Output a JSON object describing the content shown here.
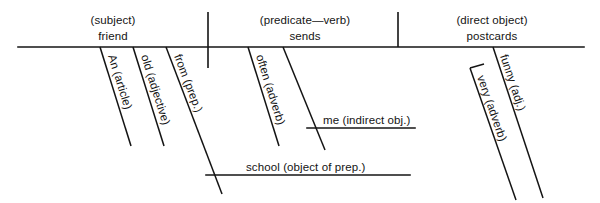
{
  "diagram": {
    "type": "reed-kellogg-sentence-diagram",
    "sentence": "An old friend from school often sends me very funny postcards.",
    "baseline": {
      "subject": {
        "role_label": "(subject)",
        "word_label": "friend"
      },
      "predicate": {
        "role_label": "(predicate—verb)",
        "word_label": "sends"
      },
      "direct_object": {
        "role_label": "(direct object)",
        "word_label": "postcards"
      }
    },
    "modifiers": [
      {
        "id": "article",
        "text": "An (article)",
        "attaches_to": "friend"
      },
      {
        "id": "adjective",
        "text": "old (adjective)",
        "attaches_to": "friend"
      },
      {
        "id": "preposition",
        "text": "from (prep.)",
        "attaches_to": "friend"
      },
      {
        "id": "adverb-often",
        "text": "often (adverb)",
        "attaches_to": "sends"
      },
      {
        "id": "indirect-object-slant",
        "text": "me (indirect obj.)",
        "attaches_to": "sends"
      },
      {
        "id": "object-of-prep",
        "text": "school (object of prep.)",
        "attaches_to": "from"
      },
      {
        "id": "adjective-funny",
        "text": "funny (adj.)",
        "attaches_to": "postcards"
      },
      {
        "id": "adverb-very",
        "text": "very (adverb)",
        "attaches_to": "funny"
      }
    ],
    "colors": {
      "ink": "#141414",
      "paper": "#ffffff"
    }
  }
}
